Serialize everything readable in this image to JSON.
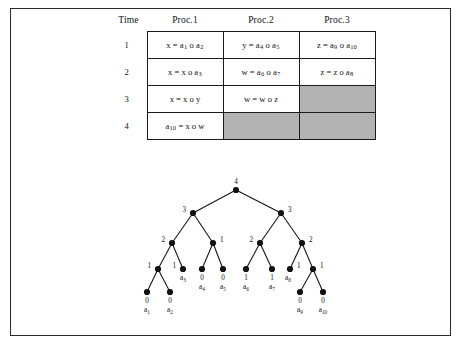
{
  "figure": {
    "border_color": "#2b2b2b",
    "background": "#ffffff",
    "shaded_cell_color": "#b2b2b2"
  },
  "table": {
    "headers": [
      "Time",
      "Proc.1",
      "Proc.2",
      "Proc.3"
    ],
    "rows": [
      {
        "time": "1",
        "cells": [
          {
            "text": "x = a1 o a2",
            "shaded": false
          },
          {
            "text": "y = a4 o a5",
            "shaded": false
          },
          {
            "text": "z = a9 o a10",
            "shaded": false
          }
        ]
      },
      {
        "time": "2",
        "cells": [
          {
            "text": "x = x o a3",
            "shaded": false
          },
          {
            "text": "w = a6 o a7",
            "shaded": false
          },
          {
            "text": "z = z o a8",
            "shaded": false
          }
        ]
      },
      {
        "time": "3",
        "cells": [
          {
            "text": "x = x o y",
            "shaded": false
          },
          {
            "text": "w = w o z",
            "shaded": false
          },
          {
            "text": "",
            "shaded": true
          }
        ]
      },
      {
        "time": "4",
        "cells": [
          {
            "text": "a10 = x o w",
            "shaded": false
          },
          {
            "text": "",
            "shaded": true
          },
          {
            "text": "",
            "shaded": true
          }
        ]
      }
    ]
  },
  "chart_data": {
    "type": "diagram",
    "title": "",
    "subtype": "binary-computation-tree",
    "nodes": [
      {
        "id": "n-root",
        "label": "4",
        "x": 236,
        "y": 190,
        "label_x": 236,
        "label_y": 184,
        "label_anchor": "middle",
        "level": 0
      },
      {
        "id": "n-l",
        "label": "3",
        "x": 193,
        "y": 213,
        "label_x": 186,
        "label_y": 212,
        "label_anchor": "end",
        "level": 1
      },
      {
        "id": "n-r",
        "label": "3",
        "x": 281,
        "y": 213,
        "label_x": 288,
        "label_y": 212,
        "label_anchor": "start",
        "level": 1
      },
      {
        "id": "n-ll",
        "label": "2",
        "x": 172,
        "y": 243,
        "label_x": 165,
        "label_y": 242,
        "label_anchor": "end",
        "level": 2
      },
      {
        "id": "n-lr",
        "label": "1",
        "x": 213,
        "y": 243,
        "label_x": 220,
        "label_y": 242,
        "label_anchor": "start",
        "level": 2
      },
      {
        "id": "n-rl",
        "label": "2",
        "x": 260,
        "y": 243,
        "label_x": 253,
        "label_y": 242,
        "label_anchor": "end",
        "level": 2
      },
      {
        "id": "n-rr",
        "label": "2",
        "x": 302,
        "y": 243,
        "label_x": 309,
        "label_y": 242,
        "label_anchor": "start",
        "level": 2
      },
      {
        "id": "n-lll",
        "label": "1",
        "x": 158,
        "y": 269,
        "label_x": 151,
        "label_y": 268,
        "label_anchor": "end",
        "level": 3
      },
      {
        "id": "n-llr",
        "label": "1",
        "x": 183,
        "y": 269,
        "label_x": 176,
        "label_y": 268,
        "label_anchor": "end",
        "level": 3
      },
      {
        "id": "n-lrl",
        "label": "",
        "x": 202,
        "y": 269,
        "label_x": 202,
        "label_y": 268,
        "label_anchor": "middle",
        "level": 3
      },
      {
        "id": "n-lrr",
        "label": "",
        "x": 223,
        "y": 269,
        "label_x": 223,
        "label_y": 268,
        "label_anchor": "middle",
        "level": 3
      },
      {
        "id": "n-rll",
        "label": "",
        "x": 246,
        "y": 269,
        "label_x": 246,
        "label_y": 268,
        "label_anchor": "middle",
        "level": 3
      },
      {
        "id": "n-rlr",
        "label": "",
        "x": 272,
        "y": 269,
        "label_x": 272,
        "label_y": 268,
        "label_anchor": "middle",
        "level": 3
      },
      {
        "id": "n-rrl",
        "label": "1",
        "x": 290,
        "y": 269,
        "label_x": 297,
        "label_y": 268,
        "label_anchor": "start",
        "level": 3
      },
      {
        "id": "n-rrr",
        "label": "1",
        "x": 313,
        "y": 269,
        "label_x": 320,
        "label_y": 268,
        "label_anchor": "start",
        "level": 3
      },
      {
        "id": "n-a1",
        "label": "",
        "x": 147,
        "y": 292,
        "label_x": 147,
        "label_y": 292,
        "label_anchor": "middle",
        "level": 4
      },
      {
        "id": "n-a2",
        "label": "",
        "x": 170,
        "y": 292,
        "label_x": 170,
        "label_y": 292,
        "label_anchor": "middle",
        "level": 4
      },
      {
        "id": "n-a9",
        "label": "",
        "x": 300,
        "y": 292,
        "label_x": 300,
        "label_y": 292,
        "label_anchor": "middle",
        "level": 4
      },
      {
        "id": "n-a10",
        "label": "",
        "x": 323,
        "y": 292,
        "label_x": 323,
        "label_y": 292,
        "label_anchor": "middle",
        "level": 4
      }
    ],
    "edges": [
      {
        "from": "n-root",
        "to": "n-l"
      },
      {
        "from": "n-root",
        "to": "n-r"
      },
      {
        "from": "n-l",
        "to": "n-ll"
      },
      {
        "from": "n-l",
        "to": "n-lr"
      },
      {
        "from": "n-r",
        "to": "n-rl"
      },
      {
        "from": "n-r",
        "to": "n-rr"
      },
      {
        "from": "n-ll",
        "to": "n-lll"
      },
      {
        "from": "n-ll",
        "to": "n-llr"
      },
      {
        "from": "n-lr",
        "to": "n-lrl"
      },
      {
        "from": "n-lr",
        "to": "n-lrr"
      },
      {
        "from": "n-rl",
        "to": "n-rll"
      },
      {
        "from": "n-rl",
        "to": "n-rlr"
      },
      {
        "from": "n-rr",
        "to": "n-rrl"
      },
      {
        "from": "n-rr",
        "to": "n-rrr"
      },
      {
        "from": "n-lll",
        "to": "n-a1"
      },
      {
        "from": "n-lll",
        "to": "n-a2"
      },
      {
        "from": "n-rrr",
        "to": "n-a9"
      },
      {
        "from": "n-rrr",
        "to": "n-a10"
      }
    ],
    "leaf_labels": [
      {
        "id": "leaf-a1",
        "weight": "0",
        "name": "a",
        "index": "1",
        "x": 147,
        "y": 303
      },
      {
        "id": "leaf-a2",
        "weight": "0",
        "name": "a",
        "index": "2",
        "x": 170,
        "y": 303
      },
      {
        "id": "leaf-a3",
        "weight": "",
        "name": "a",
        "index": "3",
        "x": 183,
        "y": 280
      },
      {
        "id": "leaf-a4",
        "weight": "0",
        "name": "a",
        "index": "4",
        "x": 202,
        "y": 280
      },
      {
        "id": "leaf-a5",
        "weight": "0",
        "name": "a",
        "index": "5",
        "x": 223,
        "y": 280
      },
      {
        "id": "leaf-a6",
        "weight": "1",
        "name": "a",
        "index": "6",
        "x": 246,
        "y": 280
      },
      {
        "id": "leaf-a7",
        "weight": "1",
        "name": "a",
        "index": "7",
        "x": 272,
        "y": 280
      },
      {
        "id": "leaf-a8",
        "weight": "",
        "name": "a",
        "index": "8",
        "x": 288,
        "y": 280
      },
      {
        "id": "leaf-a9",
        "weight": "0",
        "name": "a",
        "index": "9",
        "x": 300,
        "y": 303
      },
      {
        "id": "leaf-a10",
        "weight": "0",
        "name": "a",
        "index": "10",
        "x": 323,
        "y": 303
      }
    ]
  }
}
